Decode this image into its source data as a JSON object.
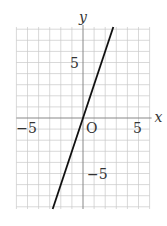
{
  "chart_data": {
    "type": "line",
    "title": "",
    "xlabel": "x",
    "ylabel": "y",
    "origin_label": "O",
    "xlim": [
      -6,
      6
    ],
    "ylim": [
      -8.2,
      8.2
    ],
    "grid": true,
    "grid_step": 1,
    "x_ticks": [
      {
        "value": -5,
        "label": "−5"
      },
      {
        "value": 5,
        "label": "5"
      }
    ],
    "y_ticks": [
      {
        "value": 5,
        "label": "5"
      },
      {
        "value": -5,
        "label": "−5"
      }
    ],
    "series": [
      {
        "name": "y = 3x",
        "slope": 3,
        "intercept": 0,
        "x": [
          -2.73,
          2.73
        ],
        "y": [
          -8.2,
          8.2
        ],
        "color": "#111111"
      }
    ]
  }
}
